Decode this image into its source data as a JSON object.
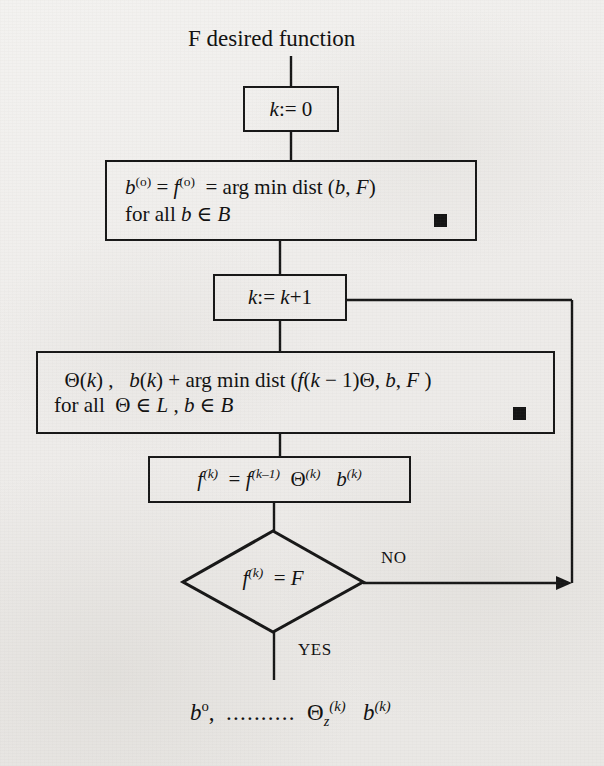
{
  "diagram": {
    "type": "flowchart",
    "title": "F desired function",
    "nodes": {
      "init": {
        "shape": "rectangle",
        "text": "k:= 0"
      },
      "base": {
        "shape": "rectangle",
        "line1_parts": [
          "b",
          "(o)",
          " = f",
          "(o)",
          " = arg min dist (b, F)"
        ],
        "line1": "b(o) = f(o) = arg min dist (b, F)",
        "line2": "for all b ∈ B",
        "marker": "filled-square"
      },
      "increment": {
        "shape": "rectangle",
        "text": "k:= k+1"
      },
      "search": {
        "shape": "rectangle",
        "line1": "Θ(k) ,   b(k) + arg min dist (f(k − 1)Θ, b, F )",
        "line2": "for all  Θ ∈ L , b ∈ B",
        "marker": "filled-square"
      },
      "update": {
        "shape": "rectangle",
        "text": "f(k) = f(k−1) Θ(k) b(k)"
      },
      "decision": {
        "shape": "diamond",
        "text": "f(k) = F",
        "branch_no": "NO",
        "branch_yes": "YES"
      },
      "result": {
        "shape": "text",
        "text": "b°, .......... Θz(k) b(k)",
        "dots": ".........."
      }
    },
    "colors": {
      "stroke": "#171717",
      "marker": "#141414",
      "paper": "#eeecea"
    }
  }
}
